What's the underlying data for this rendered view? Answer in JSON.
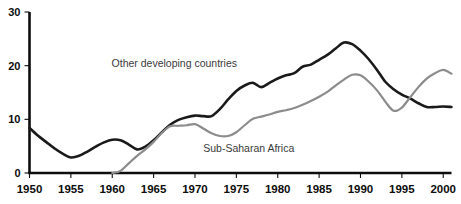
{
  "chart_data": {
    "type": "line",
    "title": "",
    "subtitle": "",
    "xlabel": "",
    "ylabel": "",
    "xlim": [
      1950,
      2001
    ],
    "ylim": [
      0,
      30
    ],
    "grid": false,
    "legend_position": "inline-annotations",
    "x_ticks": [
      "1950",
      "1955",
      "1960",
      "1965",
      "1970",
      "1975",
      "1980",
      "1985",
      "1990",
      "1995",
      "2000"
    ],
    "x_tick_values": [
      1950,
      1955,
      1960,
      1965,
      1970,
      1975,
      1980,
      1985,
      1990,
      1995,
      2000
    ],
    "y_ticks": [
      "0",
      "10",
      "20",
      "30"
    ],
    "y_tick_values": [
      0,
      10,
      20,
      30
    ],
    "x": [
      1950,
      1951,
      1952,
      1953,
      1954,
      1955,
      1956,
      1957,
      1958,
      1959,
      1960,
      1961,
      1962,
      1963,
      1964,
      1965,
      1966,
      1967,
      1968,
      1969,
      1970,
      1971,
      1972,
      1973,
      1974,
      1975,
      1976,
      1977,
      1978,
      1979,
      1980,
      1981,
      1982,
      1983,
      1984,
      1985,
      1986,
      1987,
      1988,
      1989,
      1990,
      1991,
      1992,
      1993,
      1994,
      1995,
      1996,
      1997,
      1998,
      1999,
      2000,
      2001
    ],
    "series": [
      {
        "name": "Other developing countries",
        "color": "#1a1a1a",
        "label_x": 1967.5,
        "label_y": 20.5,
        "values": [
          8.4,
          7.0,
          5.8,
          4.6,
          3.6,
          2.9,
          3.2,
          4.0,
          4.9,
          5.7,
          6.2,
          6.1,
          5.3,
          4.4,
          4.9,
          6.1,
          7.6,
          9.0,
          9.9,
          10.4,
          10.7,
          10.6,
          10.6,
          11.9,
          13.7,
          15.3,
          16.3,
          16.8,
          16.0,
          16.8,
          17.6,
          18.2,
          18.6,
          19.8,
          20.2,
          21.1,
          22.0,
          23.2,
          24.3,
          24.0,
          22.8,
          21.2,
          19.2,
          17.0,
          15.6,
          14.6,
          13.9,
          13.0,
          12.3,
          12.3,
          12.4,
          12.3
        ]
      },
      {
        "name": "Sub-Saharan Africa",
        "color": "#8c8c8c",
        "label_x": 1976.5,
        "label_y": 4.6,
        "values": [
          0.0,
          0.0,
          0.0,
          0.0,
          0.0,
          0.0,
          0.0,
          0.0,
          0.0,
          0.0,
          0.0,
          0.4,
          1.8,
          3.2,
          4.4,
          5.8,
          7.5,
          8.7,
          8.8,
          8.9,
          9.1,
          8.3,
          7.4,
          6.9,
          6.9,
          7.6,
          8.9,
          10.1,
          10.5,
          10.9,
          11.4,
          11.7,
          12.1,
          12.7,
          13.4,
          14.2,
          15.1,
          16.3,
          17.4,
          18.3,
          18.2,
          17.0,
          15.4,
          13.3,
          11.6,
          12.2,
          14.1,
          16.0,
          17.6,
          18.6,
          19.2,
          18.5
        ]
      }
    ],
    "annotations": [
      {
        "text": "Other developing countries",
        "x": 1967.5,
        "y": 20.5
      },
      {
        "text": "Sub-Saharan Africa",
        "x": 1976.5,
        "y": 4.6
      }
    ]
  },
  "colors": {
    "background": "#ffffff",
    "axis": "#0d0d0d",
    "tick_label": "#0d0d0d",
    "annotation": "#3a3a3a",
    "series_dark": "#1a1a1a",
    "series_gray": "#8c8c8c"
  }
}
